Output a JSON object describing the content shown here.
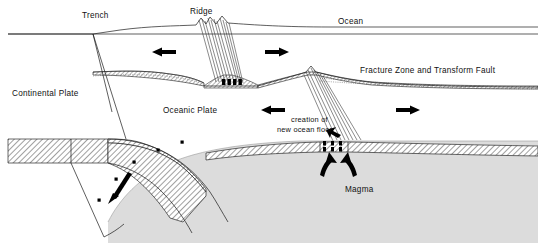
{
  "figure": {
    "type": "geological-cross-section",
    "background_color": "#ffffff",
    "line_color": "#111111",
    "mantle_fill": "#d9d9d9",
    "crust_hatch_color": "#555555"
  },
  "labels": {
    "trench": "Trench",
    "ridge": "Ridge",
    "ocean": "Ocean",
    "fracture_zone": "Fracture Zone and Transform Fault",
    "continental_plate": "Continental Plate",
    "oceanic_plate": "Oceanic Plate",
    "creation_line1": "creation of",
    "creation_line2": "new ocean floor",
    "magma": "Magma"
  },
  "arrows": [
    {
      "id": "arrow-ocean-left-upper",
      "direction": "left",
      "region": "upper-left-oceanic-plate"
    },
    {
      "id": "arrow-ocean-right-upper",
      "direction": "right",
      "region": "upper-right-of-ridge"
    },
    {
      "id": "arrow-ocean-left-lower",
      "direction": "left",
      "region": "lower-left-oceanic-plate"
    },
    {
      "id": "arrow-ocean-right-lower",
      "direction": "right",
      "region": "lower-right-oceanic-plate"
    },
    {
      "id": "arrow-subduction",
      "direction": "down-left",
      "region": "subducting-slab"
    },
    {
      "id": "arrow-magma-left",
      "direction": "up-right",
      "region": "magma-rise-left"
    },
    {
      "id": "arrow-magma-right",
      "direction": "up-left",
      "region": "magma-rise-right"
    },
    {
      "id": "arrow-creation-pointer",
      "direction": "right",
      "region": "creation-of-new-ocean-floor-callout"
    }
  ],
  "features": {
    "ridge_crest_upper": "spreading center with dike swarm and magma chamber (upper ridge)",
    "ridge_crest_lower": "spreading center with dike swarm and magma chamber (lower ridge)",
    "subduction_zone": "oceanic plate descending beneath continental plate at trench",
    "earthquake_foci": "black square markers along the subducting slab"
  }
}
